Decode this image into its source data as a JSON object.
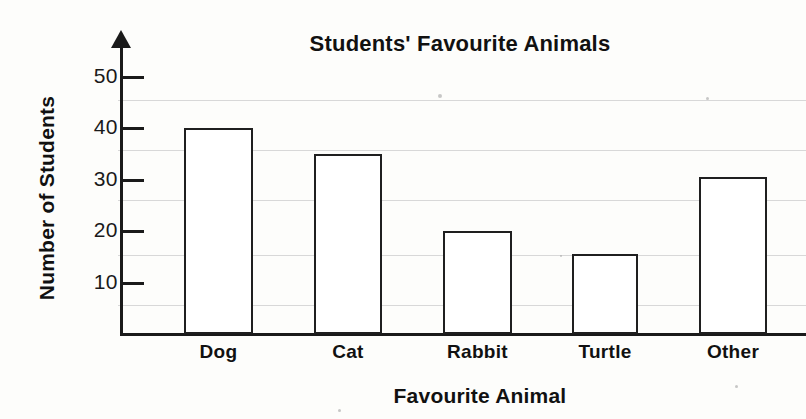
{
  "chart_data": {
    "type": "bar",
    "title": "Students' Favourite Animals",
    "xlabel": "Favourite Animal",
    "ylabel": "Number of Students",
    "categories": [
      "Dog",
      "Cat",
      "Rabbit",
      "Turtle",
      "Other"
    ],
    "values": [
      40,
      35,
      20,
      15.5,
      30.5
    ],
    "ylim": [
      0,
      55
    ],
    "yticks": [
      10,
      20,
      30,
      40,
      50
    ],
    "ytick_labels": [
      "10",
      "20",
      "30",
      "40",
      "50"
    ],
    "grid": true,
    "legend": null,
    "bar_style": {
      "fill": "#ffffff",
      "edge": "#1f1f1f"
    }
  },
  "axis": {
    "tick_values": [
      {
        "label": "50",
        "value": 50
      },
      {
        "label": "40",
        "value": 40
      },
      {
        "label": "30",
        "value": 30
      },
      {
        "label": "20",
        "value": 20
      },
      {
        "label": "10",
        "value": 10
      }
    ]
  },
  "bars": [
    {
      "label": "Dog",
      "value": 40,
      "left": 184,
      "width": 69
    },
    {
      "label": "Cat",
      "value": 35,
      "left": 314,
      "width": 68
    },
    {
      "label": "Rabbit",
      "value": 20,
      "left": 443,
      "width": 69
    },
    {
      "label": "Turtle",
      "value": 15.5,
      "left": 572,
      "width": 66
    },
    {
      "label": "Other",
      "value": 30.5,
      "left": 699,
      "width": 68
    }
  ],
  "gridlines": [
    100,
    150,
    200,
    255,
    305
  ],
  "colors": {
    "ink": "#1a1a1a",
    "paper": "#fdfdfb",
    "rule": "#d8d8d8"
  }
}
